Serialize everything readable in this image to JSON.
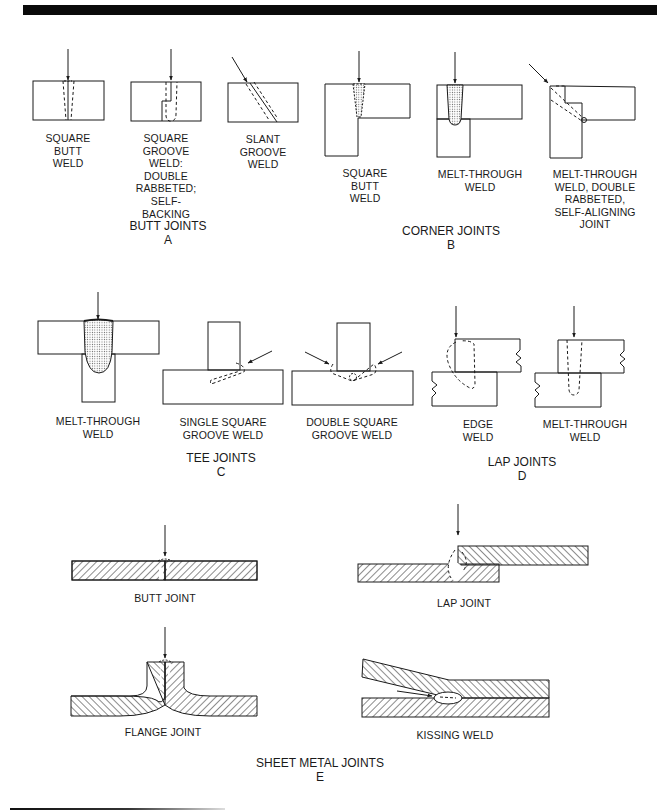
{
  "figure": {
    "sections": {
      "butt": {
        "title": "BUTT JOINTS\nA",
        "items": [
          {
            "label": "SQUARE\nBUTT\nWELD"
          },
          {
            "label": "SQUARE\nGROOVE\nWELD:\nDOUBLE\nRABBETED;\nSELF-\nBACKING"
          },
          {
            "label": "SLANT\nGROOVE\nWELD"
          }
        ]
      },
      "corner": {
        "title": "CORNER JOINTS\nB",
        "items": [
          {
            "label": "SQUARE\nBUTT\nWELD"
          },
          {
            "label": "MELT-THROUGH\nWELD"
          },
          {
            "label": "MELT-THROUGH\nWELD, DOUBLE\nRABBETED,\nSELF-ALIGNING\nJOINT"
          }
        ]
      },
      "tee": {
        "title": "TEE JOINTS\nC",
        "items": [
          {
            "label": "MELT-THROUGH\nWELD"
          },
          {
            "label": "SINGLE SQUARE\nGROOVE WELD"
          },
          {
            "label": "DOUBLE SQUARE\nGROOVE WELD"
          }
        ]
      },
      "lap": {
        "title": "LAP JOINTS\nD",
        "items": [
          {
            "label": "EDGE\nWELD"
          },
          {
            "label": "MELT-THROUGH\nWELD"
          }
        ]
      },
      "sheet": {
        "title": "SHEET METAL JOINTS\nE",
        "items": [
          {
            "label": "BUTT JOINT"
          },
          {
            "label": "LAP JOINT"
          },
          {
            "label": "FLANGE JOINT"
          },
          {
            "label": "KISSING WELD"
          }
        ]
      }
    },
    "colors": {
      "ink": "#1a1a1a",
      "stipple": "#8a8a8a",
      "background": "#ffffff"
    }
  }
}
